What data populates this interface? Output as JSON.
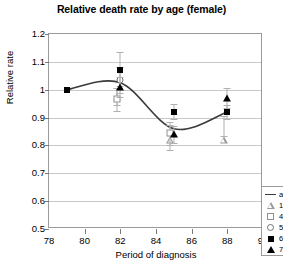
{
  "chart_data": {
    "type": "scatter",
    "title": "Relative death rate by age (female)",
    "xlabel": "Period of diagnosis",
    "ylabel": "Relative rate",
    "xlim": [
      78,
      90
    ],
    "ylim": [
      0.5,
      1.2
    ],
    "xticks": [
      "78",
      "80",
      "82",
      "84",
      "86",
      "88",
      "90"
    ],
    "yticks": [
      "0.5",
      "0.6",
      "0.7",
      "0.8",
      "0.9",
      "1",
      "1.1",
      "1.2"
    ],
    "grid": true,
    "legend_position": "bottom-right",
    "legend": [
      {
        "label": "all",
        "marker": "line"
      },
      {
        "label": "15-44",
        "marker": "triangle-open"
      },
      {
        "label": "45-54",
        "marker": "square-open"
      },
      {
        "label": "55-64",
        "marker": "circle-open"
      },
      {
        "label": "65-74",
        "marker": "square-filled"
      },
      {
        "label": "75+",
        "marker": "triangle-filled"
      }
    ],
    "series": [
      {
        "name": "all",
        "marker": "line",
        "x": [
          79,
          82,
          85,
          88
        ],
        "values": [
          1.0,
          1.025,
          0.86,
          0.92
        ]
      },
      {
        "name": "15-44",
        "marker": "triangle-open",
        "x": [
          82,
          85,
          88
        ],
        "values": [
          0.975,
          0.845,
          0.87
        ],
        "err_low": [
          0.945,
          0.8,
          0.835
        ],
        "err_high": [
          1.005,
          0.875,
          0.905
        ]
      },
      {
        "name": "45-54",
        "marker": "square-open",
        "x": [
          82,
          85
        ],
        "values": [
          0.965,
          0.845
        ],
        "err_low": [
          0.925,
          0.785
        ],
        "err_high": [
          1.005,
          0.885
        ]
      },
      {
        "name": "55-64",
        "marker": "circle-open",
        "x": [
          82
        ],
        "values": [
          1.035
        ],
        "err_low": [
          0.99
        ],
        "err_high": [
          1.08
        ]
      },
      {
        "name": "65-74",
        "marker": "square-filled",
        "x": [
          79,
          82,
          85,
          88
        ],
        "values": [
          1.0,
          1.07,
          0.92,
          0.92
        ],
        "err_low": [
          1.0,
          1.015,
          0.895,
          0.895
        ],
        "err_high": [
          1.0,
          1.135,
          0.95,
          0.945
        ]
      },
      {
        "name": "75+",
        "marker": "triangle-filled",
        "x": [
          82,
          85,
          88
        ],
        "values": [
          1.01,
          0.84,
          0.97
        ],
        "err_low": [
          0.975,
          0.81,
          0.935
        ],
        "err_high": [
          1.045,
          0.87,
          1.005
        ]
      }
    ]
  }
}
